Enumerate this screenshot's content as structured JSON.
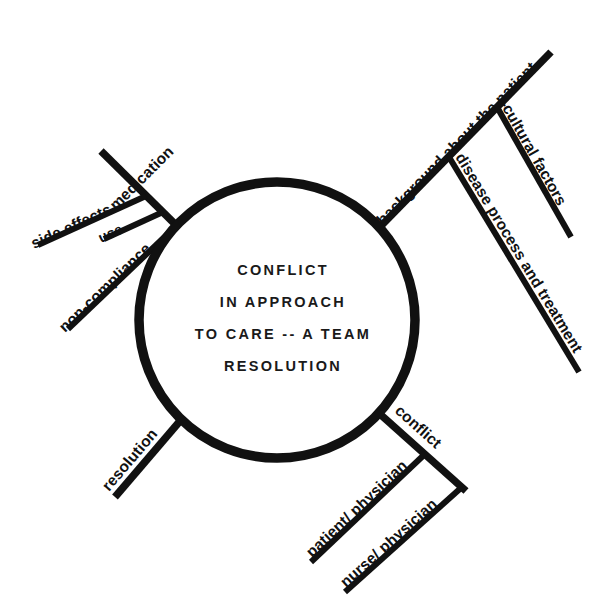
{
  "diagram": {
    "type": "fishbone-cause-and-effect",
    "background_color": "#ffffff",
    "line_color": "#111111",
    "hub": {
      "name": "center-circle",
      "center_x": 277,
      "center_y": 320,
      "radius": 138,
      "lines": [
        "CONFLICT",
        "IN APPROACH",
        "TO CARE -- A TEAM",
        "RESOLUTION"
      ]
    },
    "branches": [
      {
        "id": "medication",
        "label": "medication",
        "position": "upper-left",
        "sub_branches": [
          {
            "id": "side-effects",
            "label": "side effects"
          },
          {
            "id": "use",
            "label": "use"
          },
          {
            "id": "non-compliance",
            "label": "non-compliance"
          }
        ]
      },
      {
        "id": "background-about-the-patient",
        "label": "background about the patient",
        "position": "upper-right",
        "sub_branches": [
          {
            "id": "cultural-factors",
            "label": "cultural factors"
          },
          {
            "id": "disease-process-and-treatment",
            "label": "disease process and treatment"
          }
        ]
      },
      {
        "id": "resolution",
        "label": "resolution",
        "position": "lower-left",
        "sub_branches": []
      },
      {
        "id": "conflict",
        "label": "conflict",
        "position": "lower-right",
        "sub_branches": [
          {
            "id": "patient-physician",
            "label": "patient/ physician"
          },
          {
            "id": "nurse-physician",
            "label": "nurse/ physician"
          }
        ]
      }
    ]
  }
}
